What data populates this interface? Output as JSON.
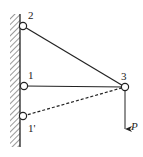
{
  "diagram": {
    "type": "truss-structure",
    "colors": {
      "stroke": "#222222",
      "background": "#ffffff",
      "hatch": "#555555"
    },
    "wall": {
      "x": 20,
      "y_top": 14,
      "y_bottom": 147,
      "hatch_width": 10
    },
    "nodes": [
      {
        "id": "2",
        "label": "2",
        "x": 23,
        "y": 26,
        "label_x": 29,
        "label_y": 18
      },
      {
        "id": "1",
        "label": "1",
        "x": 24,
        "y": 86,
        "label_x": 28,
        "label_y": 78
      },
      {
        "id": "1p",
        "label": "1'",
        "x": 23,
        "y": 116,
        "label_x": 28,
        "label_y": 132
      },
      {
        "id": "3",
        "label": "3",
        "x": 125,
        "y": 87,
        "label_x": 122,
        "label_y": 79
      }
    ],
    "members": [
      {
        "from": "2",
        "to": "3",
        "style": "solid"
      },
      {
        "from": "1",
        "to": "3",
        "style": "solid"
      },
      {
        "from": "1p",
        "to": "3",
        "style": "dashed"
      }
    ],
    "load": {
      "label": "P",
      "at_node": "3",
      "direction": "down",
      "x": 125,
      "y_start": 91,
      "y_end": 130,
      "label_x": 131,
      "label_y": 130
    }
  }
}
